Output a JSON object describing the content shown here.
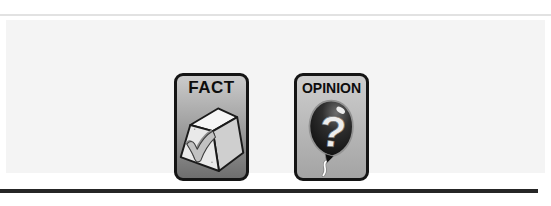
{
  "page": {
    "background_color": "#ffffff",
    "panel_color": "#f4f4f4",
    "top_rule_color": "#e2e2e2",
    "bottom_rule_color": "#262626"
  },
  "cards": [
    {
      "label": "FACT",
      "icon": "fact-checkmark-stone-icon",
      "border_color": "#141414",
      "background_top": "#cbcbcb",
      "background_bottom": "#6e6e6e"
    },
    {
      "label": "OPINION",
      "icon": "opinion-question-balloon-icon",
      "border_color": "#141414",
      "background_top": "#cecece",
      "background_bottom": "#a4a4a4"
    }
  ]
}
